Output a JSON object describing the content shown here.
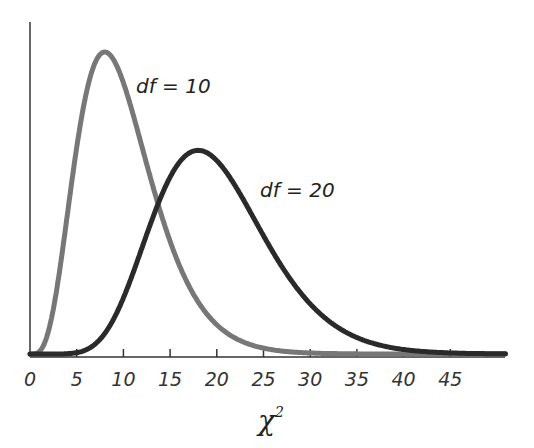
{
  "chart_data": {
    "type": "line",
    "title": "",
    "xlabel": "χ²",
    "xlabel_base": "χ",
    "xlabel_sup": "2",
    "ylabel": "",
    "xlim": [
      0,
      50
    ],
    "ylim": [
      0,
      0.1
    ],
    "grid": false,
    "legend": "none (inline annotations)",
    "x_ticks": [
      0,
      5,
      10,
      15,
      20,
      25,
      30,
      35,
      40,
      45
    ],
    "x_tick_labels": [
      "0",
      "5",
      "10",
      "15",
      "20",
      "25",
      "30",
      "35",
      "40",
      "45"
    ],
    "series": [
      {
        "name": "df = 10",
        "df": 10,
        "color": "#777777",
        "peak_x": 8,
        "peak_y": 0.0977,
        "annotation": "df = 10",
        "x": [
          0,
          2,
          4,
          6,
          8,
          10,
          12,
          14,
          16,
          18,
          20,
          25,
          30,
          35,
          40,
          45,
          50
        ],
        "values": [
          0,
          0.0077,
          0.0361,
          0.0671,
          0.0781,
          0.0877,
          0.0803,
          0.0612,
          0.0424,
          0.0274,
          0.0146,
          0.0033,
          0.0005,
          0.0001,
          0,
          0,
          0
        ]
      },
      {
        "name": "df = 20",
        "df": 20,
        "color": "#2a2a2a",
        "peak_x": 18,
        "peak_y": 0.0657,
        "annotation": "df = 20",
        "x": [
          0,
          5,
          10,
          15,
          18,
          20,
          25,
          30,
          35,
          40,
          45,
          50
        ],
        "values": [
          0,
          0.0002,
          0.0092,
          0.0515,
          0.0657,
          0.0626,
          0.0446,
          0.0197,
          0.0066,
          0.0018,
          0.0004,
          0.0001
        ]
      }
    ]
  }
}
